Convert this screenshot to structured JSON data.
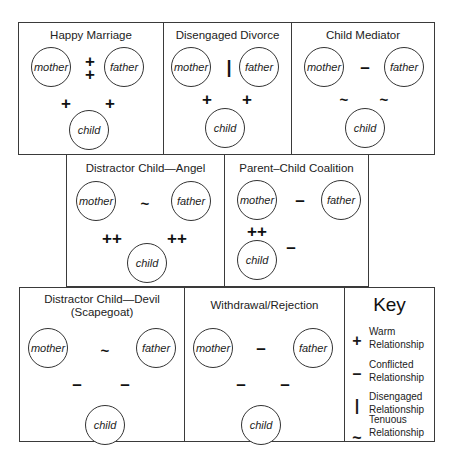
{
  "panels": {
    "happy_marriage": {
      "title": "Happy Marriage",
      "nodes": {
        "mother": "mother",
        "father": "father",
        "child": "child"
      },
      "relations": {
        "mother_father": "+\n+",
        "mother_child": "+",
        "father_child": "+"
      }
    },
    "disengaged_divorce": {
      "title": "Disengaged Divorce",
      "nodes": {
        "mother": "mother",
        "father": "father",
        "child": "child"
      },
      "relations": {
        "mother_father": "|",
        "mother_child": "+",
        "father_child": "+"
      }
    },
    "child_mediator": {
      "title": "Child Mediator",
      "nodes": {
        "mother": "mother",
        "father": "father",
        "child": "child"
      },
      "relations": {
        "mother_father": "–",
        "mother_child": "~",
        "father_child": "~"
      }
    },
    "distractor_angel": {
      "title": "Distractor Child—Angel",
      "nodes": {
        "mother": "mother",
        "father": "father",
        "child": "child"
      },
      "relations": {
        "mother_father": "~",
        "mother_child": "++",
        "father_child": "++"
      }
    },
    "parent_child_coalition": {
      "title": "Parent–Child Coalition",
      "nodes": {
        "mother": "mother",
        "father": "father",
        "child": "child"
      },
      "relations": {
        "mother_father": "–",
        "mother_child": "++",
        "father_child": "–"
      }
    },
    "distractor_devil": {
      "title_line1": "Distractor Child—Devil",
      "title_line2": "(Scapegoat)",
      "nodes": {
        "mother": "mother",
        "father": "father",
        "child": "child"
      },
      "relations": {
        "mother_father": "~",
        "mother_child": "–",
        "father_child": "–"
      }
    },
    "withdrawal_rejection": {
      "title": "Withdrawal/Rejection",
      "nodes": {
        "mother": "mother",
        "father": "father",
        "child": "child"
      },
      "relations": {
        "mother_father": "–",
        "mother_child": "–",
        "father_child": "–"
      }
    }
  },
  "key": {
    "title": "Key",
    "items": [
      {
        "symbol": "+",
        "line1": "Warm",
        "line2": "Relationship"
      },
      {
        "symbol": "–",
        "line1": "Conflicted",
        "line2": "Relationship"
      },
      {
        "symbol": "|",
        "line1": "Disengaged",
        "line2": "Relationship"
      },
      {
        "symbol": "~",
        "line1": "Tenuous",
        "line2": "Relationship"
      }
    ]
  }
}
